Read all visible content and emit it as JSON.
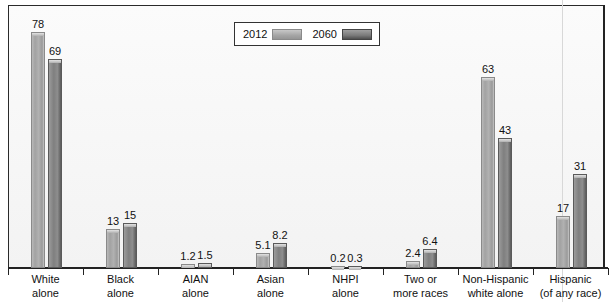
{
  "chart_data": {
    "type": "bar",
    "title": "",
    "xlabel": "",
    "ylabel": "",
    "ylim": [
      0,
      85
    ],
    "grid": false,
    "legend_position": "top-center",
    "categories": [
      "White alone",
      "Black alone",
      "AIAN alone",
      "Asian alone",
      "NHPI alone",
      "Two or more races",
      "Non-Hispanic white alone",
      "Hispanic (of any race)"
    ],
    "category_lines": [
      [
        "White",
        "alone"
      ],
      [
        "Black",
        "alone"
      ],
      [
        "AIAN",
        "alone"
      ],
      [
        "Asian",
        "alone"
      ],
      [
        "NHPI",
        "alone"
      ],
      [
        "Two or",
        "more races"
      ],
      [
        "Non-Hispanic",
        "white alone"
      ],
      [
        "Hispanic",
        "(of any race)"
      ]
    ],
    "series": [
      {
        "name": "2012",
        "values": [
          78,
          13,
          1.2,
          5.1,
          0.2,
          2.4,
          63,
          17
        ],
        "labels": [
          "78",
          "13",
          "1.2",
          "5.1",
          "0.2",
          "2.4",
          "63",
          "17"
        ],
        "color": "#a8a8a8"
      },
      {
        "name": "2060",
        "values": [
          69,
          15,
          1.5,
          8.2,
          0.3,
          6.4,
          43,
          31
        ],
        "labels": [
          "69",
          "15",
          "1.5",
          "8.2",
          "0.3",
          "6.4",
          "43",
          "31"
        ],
        "color": "#7e7e7e"
      }
    ]
  },
  "legend": {
    "items": [
      {
        "label": "2012"
      },
      {
        "label": "2060"
      }
    ]
  }
}
